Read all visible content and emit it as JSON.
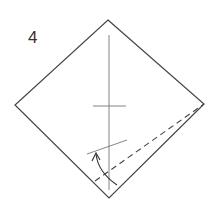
{
  "step": {
    "number": "4"
  },
  "colors": {
    "line": "#444444",
    "background": "#ffffff"
  },
  "diagram": {
    "square_vertices": {
      "top": [
        108,
        20
      ],
      "right": [
        204,
        104
      ],
      "bottom": [
        109,
        198
      ],
      "left": [
        15,
        105
      ]
    },
    "center_crease": {
      "x": 109,
      "y1": 35,
      "y2": 190
    },
    "horizontal_mark": {
      "y": 106,
      "x1": 93,
      "x2": 126
    },
    "fold_target_line": {
      "x1": 87,
      "y1": 154,
      "x2": 127,
      "y2": 140
    },
    "valley_fold_dashed": {
      "x1": 95,
      "y1": 181,
      "x2": 204,
      "y2": 104
    },
    "arrow": {
      "from": [
        117,
        185
      ],
      "to": [
        95,
        153
      ]
    }
  }
}
